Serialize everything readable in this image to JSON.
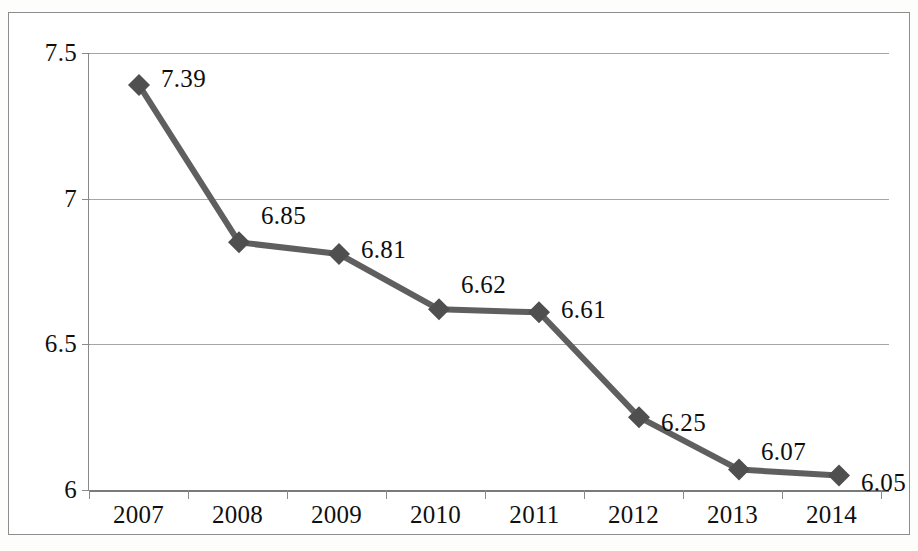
{
  "chart_data": {
    "type": "line",
    "title": "",
    "subtitle": "",
    "xlabel": "",
    "ylabel": "",
    "categories": [
      "2007",
      "2008",
      "2009",
      "2010",
      "2011",
      "2012",
      "2013",
      "2014"
    ],
    "values": [
      7.39,
      6.85,
      6.81,
      6.62,
      6.61,
      6.25,
      6.07,
      6.05
    ],
    "point_labels": [
      "7.39",
      "6.85",
      "6.81",
      "6.62",
      "6.61",
      "6.25",
      "6.07",
      "6.05"
    ],
    "series": [
      {
        "name": "",
        "values": [
          7.39,
          6.85,
          6.81,
          6.62,
          6.61,
          6.25,
          6.07,
          6.05
        ]
      }
    ],
    "ylim": [
      6,
      7.5
    ],
    "y_ticks": [
      6,
      6.5,
      7,
      7.5
    ],
    "y_tick_labels": [
      "6",
      "6.5",
      "7",
      "7.5"
    ],
    "grid": true,
    "grid_axis": "y",
    "legend": false,
    "legend_position": "none",
    "marker": "diamond",
    "annotations": []
  },
  "axes": {
    "y_tick_labels": [
      "7.5",
      "7",
      "6.5",
      "6"
    ],
    "x_tick_labels": [
      "2007",
      "2008",
      "2009",
      "2010",
      "2011",
      "2012",
      "2013",
      "2014"
    ]
  },
  "style": {
    "series_color": "#5f5f5f",
    "marker_color": "#4f4f4f",
    "gridline_color": "#a6a6a6",
    "axis_color": "#8a8a8a",
    "frame_color": "#8d8d8d",
    "text_color": "#101010",
    "background": "#ffffff"
  },
  "caption": {
    "cut_off_text": ""
  }
}
